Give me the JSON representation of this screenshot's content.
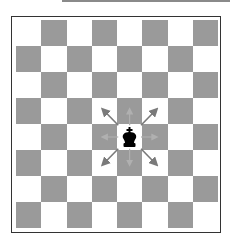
{
  "diagram": {
    "type": "chessboard",
    "files": 8,
    "ranks": 8,
    "top_left_color": "light",
    "colors": {
      "light": "#ffffff",
      "dark": "#9a9a9a",
      "border": "#333333",
      "piece": "#000000",
      "arrow_strong": "#7a7a7a",
      "arrow_faint": "#b0b0b0"
    },
    "pieces": [
      {
        "name": "king",
        "color": "black",
        "row": 4,
        "col": 4
      }
    ],
    "moves": [
      {
        "direction": "up-left",
        "strength": "strong"
      },
      {
        "direction": "up",
        "strength": "faint"
      },
      {
        "direction": "up-right",
        "strength": "strong"
      },
      {
        "direction": "left",
        "strength": "faint"
      },
      {
        "direction": "right",
        "strength": "faint"
      },
      {
        "direction": "down-left",
        "strength": "strong"
      },
      {
        "direction": "down",
        "strength": "faint"
      },
      {
        "direction": "down-right",
        "strength": "strong"
      }
    ]
  }
}
